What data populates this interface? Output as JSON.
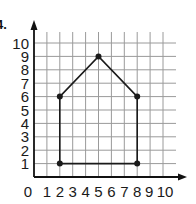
{
  "problem": {
    "number_label": "4."
  },
  "chart_data": {
    "type": "line",
    "title": "",
    "xlabel": "",
    "ylabel": "",
    "xlim": [
      0,
      10
    ],
    "ylim": [
      0,
      10
    ],
    "grid": true,
    "x_ticks": [
      "0",
      "1",
      "2",
      "3",
      "4",
      "5",
      "6",
      "7",
      "8",
      "9",
      "10"
    ],
    "y_ticks": [
      "1",
      "2",
      "3",
      "4",
      "5",
      "6",
      "7",
      "8",
      "9",
      "10"
    ],
    "series": [
      {
        "name": "polygon",
        "closed": true,
        "points": [
          {
            "x": 2,
            "y": 1
          },
          {
            "x": 2,
            "y": 6
          },
          {
            "x": 5,
            "y": 9
          },
          {
            "x": 8,
            "y": 6
          },
          {
            "x": 8,
            "y": 1
          }
        ]
      }
    ]
  },
  "style": {
    "line_color": "#1a1a1a",
    "grid_color": "#9a9a9a",
    "axis_color": "#111111"
  }
}
